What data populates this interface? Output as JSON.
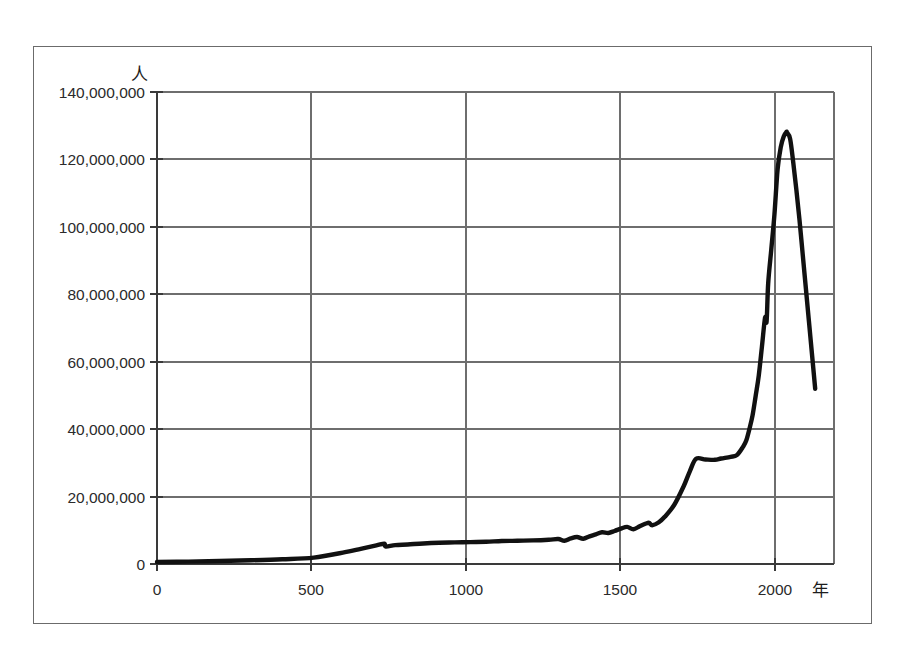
{
  "figure": {
    "background_color": "#ffffff",
    "frame_color": "#6b6b6b",
    "grid_color": "#6e6e6e",
    "line_color": "#111111"
  },
  "axes": {
    "y_unit_label": "人",
    "x_unit_label": "年",
    "y_tick_labels": [
      "140,000,000",
      "120,000,000",
      "100,000,000",
      "80,000,000",
      "60,000,000",
      "40,000,000",
      "20,000,000",
      "0"
    ],
    "x_tick_labels": [
      "0",
      "500",
      "1000",
      "1500",
      "2000"
    ]
  },
  "chart_data": {
    "type": "line",
    "title": "",
    "subtitle": "",
    "xlabel": "年",
    "ylabel": "人",
    "xlim": [
      0,
      2160
    ],
    "ylim": [
      0,
      140000000
    ],
    "xticks": [
      0,
      500,
      1000,
      1500,
      2000
    ],
    "yticks": [
      0,
      20000000,
      40000000,
      60000000,
      80000000,
      100000000,
      120000000,
      140000000
    ],
    "grid": true,
    "legend": false,
    "legend_position": "none",
    "series": [
      {
        "name": "日本の人口",
        "x": [
          0,
          100,
          200,
          300,
          400,
          500,
          600,
          650,
          700,
          725,
          730,
          760,
          800,
          850,
          900,
          950,
          1000,
          1050,
          1100,
          1150,
          1200,
          1250,
          1280,
          1300,
          1320,
          1340,
          1360,
          1380,
          1400,
          1420,
          1440,
          1460,
          1480,
          1500,
          1520,
          1540,
          1560,
          1570,
          1580,
          1600,
          1620,
          1650,
          1680,
          1700,
          1720,
          1750,
          1780,
          1800,
          1830,
          1850,
          1870,
          1880,
          1890,
          1900,
          1910,
          1920,
          1930,
          1940,
          1945,
          1950,
          1960,
          1970,
          1980,
          1990,
          2000,
          2008,
          2010,
          2020,
          2030,
          2040,
          2050,
          2060,
          2070,
          2080,
          2090,
          2100
        ],
        "y": [
          600000,
          700000,
          900000,
          1100000,
          1400000,
          1900000,
          3500000,
          4500000,
          5500000,
          6000000,
          5200000,
          5600000,
          5800000,
          6100000,
          6300000,
          6400000,
          6500000,
          6600000,
          6800000,
          6900000,
          7000000,
          7200000,
          7400000,
          6900000,
          7600000,
          8000000,
          7500000,
          8200000,
          8800000,
          9400000,
          9200000,
          9800000,
          10500000,
          11000000,
          10300000,
          11200000,
          12000000,
          12200000,
          11500000,
          12300000,
          14000000,
          17500000,
          23000000,
          27500000,
          31200000,
          31000000,
          30900000,
          31300000,
          31800000,
          32300000,
          34800000,
          36600000,
          40000000,
          44000000,
          49800000,
          55900000,
          64400000,
          73100000,
          72000000,
          83200000,
          93400000,
          103700000,
          117000000,
          123600000,
          126900000,
          128100000,
          128000000,
          126100000,
          119100000,
          110900000,
          102000000,
          92000000,
          82000000,
          72000000,
          62000000,
          52000000
        ]
      }
    ]
  }
}
